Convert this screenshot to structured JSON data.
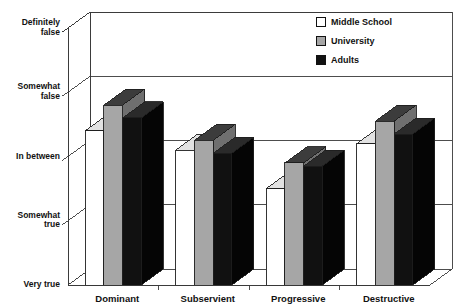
{
  "title": "Adult Roles",
  "legend": {
    "position": "top-right",
    "entries": [
      {
        "label": "Middle School",
        "swatch": "white",
        "color": "#ffffff"
      },
      {
        "label": "University",
        "swatch": "gray",
        "color": "#a6a6a6"
      },
      {
        "label": "Adults",
        "swatch": "black",
        "color": "#111111"
      }
    ]
  },
  "chart_data": {
    "type": "bar",
    "title": "Adult Roles",
    "xlabel": "",
    "ylabel": "",
    "grid": true,
    "style": "3d-grouped-column",
    "categories": [
      "Dominant",
      "Subservient",
      "Progressive",
      "Destructive"
    ],
    "ytick_labels": [
      "Definitely false",
      "Somewhat false",
      "In between",
      "Somewhat true",
      "Very true"
    ],
    "ytick_values": [
      1,
      2,
      3,
      4,
      5
    ],
    "ylim": [
      1,
      5
    ],
    "series": [
      {
        "name": "Middle School",
        "color": "#ffffff",
        "values": [
          3.4,
          3.1,
          2.5,
          3.2
        ]
      },
      {
        "name": "University",
        "color": "#a6a6a6",
        "values": [
          3.8,
          3.25,
          2.9,
          3.55
        ]
      },
      {
        "name": "Adults",
        "color": "#111111",
        "values": [
          3.6,
          3.05,
          2.85,
          3.35
        ]
      }
    ]
  },
  "axis": {
    "y_labels": [
      {
        "text": "Very true",
        "line2": ""
      },
      {
        "text": "Somewhat",
        "line2": "true"
      },
      {
        "text": "In between",
        "line2": ""
      },
      {
        "text": "Somewhat",
        "line2": "false"
      },
      {
        "text": "Definitely",
        "line2": "false"
      }
    ],
    "x_labels": [
      "Dominant",
      "Subservient",
      "Progressive",
      "Destructive"
    ]
  }
}
